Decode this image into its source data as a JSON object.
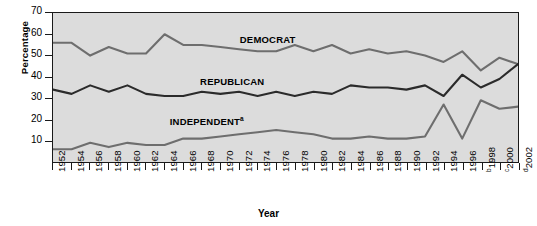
{
  "chart_data": {
    "type": "line",
    "title": "",
    "xlabel": "Year",
    "ylabel": "Percentage",
    "ylim": [
      0,
      70
    ],
    "ytick_values": [
      10,
      20,
      30,
      40,
      50,
      60,
      70
    ],
    "grid": false,
    "legend_position": "inline-annotations",
    "x": [
      1952,
      1954,
      1956,
      1958,
      1960,
      1962,
      1964,
      1966,
      1968,
      1970,
      1972,
      1974,
      1976,
      1978,
      1980,
      1982,
      1984,
      1986,
      1988,
      1990,
      1992,
      1994,
      1996,
      1998,
      2000,
      2002
    ],
    "xtick_labels": [
      "1952",
      "1954",
      "1956",
      "1958",
      "1960",
      "1962",
      "1964",
      "1966",
      "1968",
      "1970",
      "1972",
      "1974",
      "1976",
      "1978",
      "1980",
      "1982",
      "1984",
      "1986",
      "1988",
      "1990",
      "1992",
      "1994",
      "1996",
      "1998",
      "2000",
      "2002"
    ],
    "xtick_superscripts": [
      "",
      "",
      "",
      "",
      "",
      "",
      "",
      "",
      "",
      "",
      "",
      "",
      "",
      "",
      "",
      "",
      "",
      "",
      "",
      "",
      "",
      "",
      "",
      "b",
      "c",
      "d"
    ],
    "series": [
      {
        "name": "DEMOCRAT",
        "color": "#6e6e6e",
        "values": [
          56,
          56,
          50,
          54,
          51,
          51,
          60,
          55,
          55,
          54,
          53,
          52,
          52,
          55,
          52,
          55,
          51,
          53,
          51,
          52,
          50,
          47,
          52,
          43,
          49,
          46
        ]
      },
      {
        "name": "REPUBLICAN",
        "color": "#2b2b2b",
        "values": [
          34,
          32,
          36,
          33,
          36,
          32,
          31,
          31,
          33,
          32,
          33,
          31,
          33,
          31,
          33,
          32,
          36,
          35,
          35,
          34,
          36,
          31,
          41,
          35,
          39,
          46
        ]
      },
      {
        "name": "INDEPENDENT",
        "color": "#6e6e6e",
        "superscript": "a",
        "values": [
          6,
          6,
          9,
          7,
          9,
          8,
          8,
          11,
          11,
          12,
          13,
          14,
          15,
          14,
          13,
          11,
          11,
          12,
          11,
          11,
          12,
          27,
          11,
          29,
          25,
          26
        ]
      }
    ],
    "annotations": [
      {
        "text": "DEMOCRAT",
        "x_frac": 0.4,
        "y_value": 57.5
      },
      {
        "text": "REPUBLICAN",
        "x_frac": 0.315,
        "y_value": 38.0
      },
      {
        "text": "INDEPENDENT",
        "superscript": "a",
        "x_frac": 0.25,
        "y_value": 19.5
      }
    ]
  },
  "colors": {
    "plot_background": "#dcdcdc",
    "page_background": "#ffffff",
    "axis": "#1a1a1a",
    "democrat": "#6e6e6e",
    "republican": "#2b2b2b",
    "independent": "#6e6e6e"
  }
}
